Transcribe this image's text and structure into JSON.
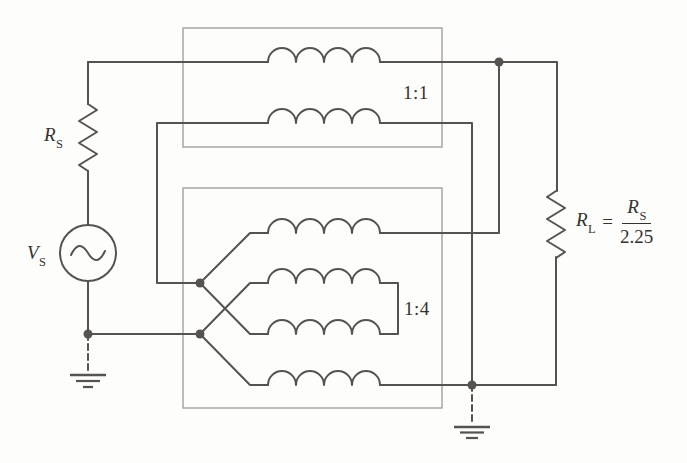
{
  "diagram": {
    "kind": "circuit-schematic",
    "colors": {
      "background": "#fdfdfb",
      "wire": "#54534f",
      "box": "#9b9a94",
      "text": "#343230"
    },
    "labels": {
      "source_resistor": {
        "base": "R",
        "sub": "S"
      },
      "source": {
        "base": "V",
        "sub": "S"
      },
      "top_transformer_ratio": "1:1",
      "bottom_transformer_ratio": "1:4",
      "load": {
        "base": "R",
        "sub": "L",
        "equals": "=",
        "num_base": "R",
        "num_sub": "S",
        "den": "2.25"
      }
    }
  }
}
